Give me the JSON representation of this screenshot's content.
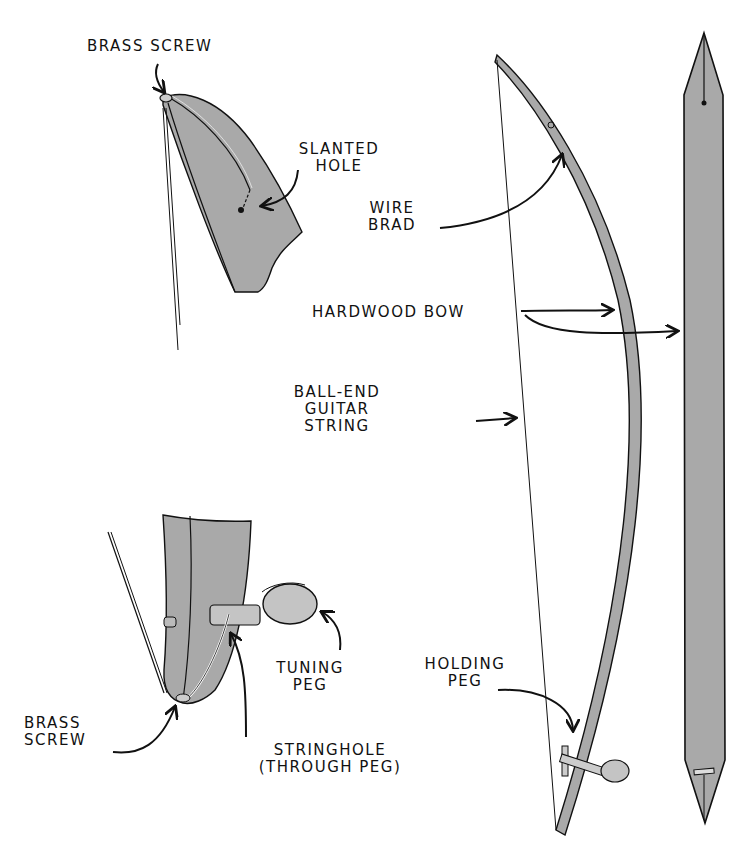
{
  "diagram": {
    "colors": {
      "wood": "#a9a9a9",
      "wood_light": "#c4c4c4",
      "ink": "#111111",
      "background": "#ffffff"
    },
    "views": {
      "top_detail": {
        "name": "bow-top-end-detail"
      },
      "bottom_detail": {
        "name": "bow-bottom-end-detail"
      },
      "side_view": {
        "name": "strung-bow-side-view"
      },
      "front_view": {
        "name": "bow-front-view"
      }
    },
    "labels": {
      "brass_screw_top": "BRASS SCREW",
      "slanted_hole": [
        "SLANTED",
        "HOLE"
      ],
      "wire_brad": [
        "WIRE",
        "BRAD"
      ],
      "hardwood_bow": "HARDWOOD BOW",
      "guitar_string": [
        "BALL-END",
        "GUITAR",
        "STRING"
      ],
      "tuning_peg": [
        "TUNING",
        "PEG"
      ],
      "holding_peg": [
        "HOLDING",
        "PEG"
      ],
      "brass_screw_bottom": [
        "BRASS",
        "SCREW"
      ],
      "string_hole": [
        "STRINGHOLE",
        "(THROUGH PEG)"
      ]
    }
  }
}
